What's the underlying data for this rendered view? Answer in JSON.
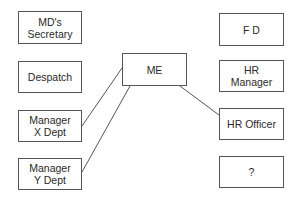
{
  "diagram": {
    "center": {
      "label": "ME"
    },
    "left_column": [
      {
        "label": "MD's\nSecretary",
        "connected": false
      },
      {
        "label": "Despatch",
        "connected": false
      },
      {
        "label": "Manager\nX Dept",
        "connected": true
      },
      {
        "label": "Manager\nY Dept",
        "connected": true
      }
    ],
    "right_column": [
      {
        "label": "F D",
        "connected": false
      },
      {
        "label": "HR\nManager",
        "connected": false
      },
      {
        "label": "HR Officer",
        "connected": true
      },
      {
        "label": "?",
        "connected": false
      }
    ],
    "connections": [
      {
        "from": "ME",
        "to": "Manager X Dept"
      },
      {
        "from": "ME",
        "to": "Manager Y Dept"
      },
      {
        "from": "ME",
        "to": "HR Officer"
      }
    ],
    "colors": {
      "border": "#555555",
      "line": "#555555",
      "text": "#2a2a2a",
      "background": "#ffffff"
    }
  }
}
